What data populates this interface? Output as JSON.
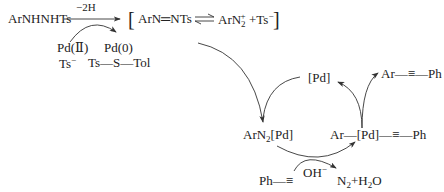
{
  "diagram": {
    "type": "reaction-mechanism",
    "top_row": {
      "reactant": "ArNHNHTs",
      "arrow_label": "−2H",
      "bracket_open": "[",
      "intermediate_1": "ArN═NTs",
      "intermediate_2_main": "ArN",
      "intermediate_2_sub": "2",
      "intermediate_2_sup": "+",
      "counter_ion": "+Ts",
      "counter_ion_sup": "−",
      "bracket_close": "]"
    },
    "pd_redox": {
      "pd2": "Pd(Ⅱ)",
      "pd0": "Pd(0)",
      "ts_anion": "Ts",
      "ts_anion_sup": "−",
      "byproduct": "Ts—S—Tol"
    },
    "cycle": {
      "catalyst": "[Pd]",
      "product": "Ar—≡—Ph",
      "aryl_diazonium_pd_main": "ArN",
      "aryl_diazonium_pd_sub": "2",
      "aryl_diazonium_pd_tail": "[Pd]",
      "alkynyl_pd": "Ar—[Pd]—≡—Ph",
      "alkyne": "Ph—≡",
      "base": "OH",
      "base_sup": "−",
      "byproducts_main": "N",
      "byproducts_sub": "2",
      "byproducts_tail": "+H",
      "byproducts_sub2": "2",
      "byproducts_tail2": "O"
    },
    "colors": {
      "line": "#333333",
      "text": "#222222",
      "background": "#ffffff"
    }
  }
}
